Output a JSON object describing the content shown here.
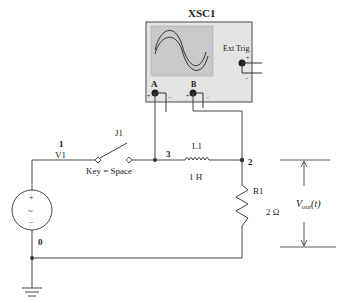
{
  "oscilloscope": {
    "name": "XSC1",
    "channel_a": "A",
    "channel_b": "B",
    "ext_trig": "Ext Trig",
    "plus": "+",
    "minus": "−",
    "body_color": "#e4e4e4",
    "screen_color": "#c9c9c9"
  },
  "nodes": {
    "n1": "1",
    "n2": "2",
    "n3": "3",
    "n0": "0"
  },
  "source": {
    "name": "V1",
    "plus": "+",
    "minus": "−",
    "symbol": "~"
  },
  "switch": {
    "name": "J1",
    "key_label": "Key = Space"
  },
  "inductor": {
    "name": "L1",
    "value": "1 H"
  },
  "resistor": {
    "name": "R1",
    "value": "2 Ω"
  },
  "output": {
    "label_main": "V",
    "label_sub": "out",
    "label_suffix": "(t)"
  }
}
